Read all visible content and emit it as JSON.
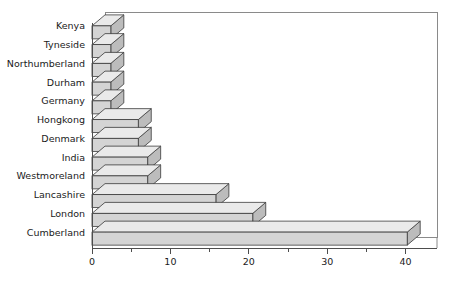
{
  "chart_data": {
    "type": "bar",
    "orientation": "horizontal",
    "title": "",
    "subtitle": "",
    "xlabel": "",
    "ylabel": "",
    "categories": [
      "Kenya",
      "Tyneside",
      "Northumberland",
      "Durham",
      "Germany",
      "Hongkong",
      "Denmark",
      "India",
      "Westmoreland",
      "Lancashire",
      "London",
      "Cumberland"
    ],
    "values": [
      2.4,
      2.4,
      2.4,
      2.4,
      2.4,
      5.9,
      5.9,
      7.1,
      7.1,
      15.8,
      20.5,
      40.2
    ],
    "xticks": [
      0,
      10,
      20,
      30,
      40
    ],
    "xtick_labels": [
      "0",
      "10",
      "20",
      "30",
      "40"
    ],
    "xminor_ticks": [
      5,
      15,
      25,
      35
    ],
    "xlim": [
      0,
      44
    ],
    "grid": false,
    "legend": null,
    "legend_position": "none",
    "style": "3d-perspective-bars"
  },
  "colors": {
    "bar_front": "#d4d4d4",
    "bar_top": "#eaeaea",
    "bar_side": "#bcbcbc",
    "bar_outline": "#3a3a3a",
    "axis": "#4d4d4d",
    "plot_border": "#8a8a8a",
    "background": "#ffffff",
    "text": "#1a1a1a"
  },
  "geometry": {
    "plot_left": 92,
    "plot_right": 437,
    "plot_top": 12,
    "plot_bottom": 248,
    "depth_x": 13,
    "depth_y": 11,
    "bar_thickness": 13,
    "x_per_unit": 7.83
  }
}
